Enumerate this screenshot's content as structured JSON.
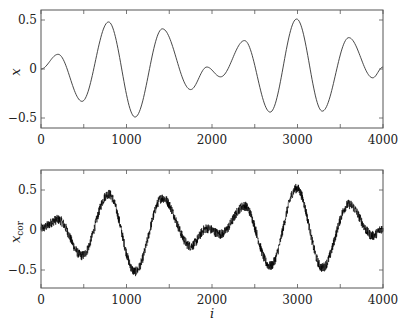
{
  "chart_data": [
    {
      "type": "line",
      "title": "",
      "xlabel": "",
      "ylabel": "x",
      "xlim": [
        0,
        4000
      ],
      "ylim": [
        -0.58,
        0.58
      ],
      "xticks": [
        "0",
        "1000",
        "2000",
        "3000",
        "4000"
      ],
      "yticks": [
        "-0.5",
        "0",
        "0.5"
      ],
      "grid": false,
      "series": [
        {
          "name": "x",
          "x": [
            0,
            200,
            480,
            790,
            1100,
            1420,
            1750,
            1940,
            2100,
            2380,
            2680,
            2990,
            3290,
            3600,
            3880,
            4000
          ],
          "values": [
            0.0,
            0.15,
            -0.33,
            0.48,
            -0.49,
            0.41,
            -0.21,
            0.02,
            -0.08,
            0.29,
            -0.44,
            0.51,
            -0.43,
            0.32,
            -0.09,
            0.02
          ]
        }
      ]
    },
    {
      "type": "line",
      "title": "",
      "xlabel": "i",
      "ylabel": "x_cor",
      "xlim": [
        0,
        4000
      ],
      "ylim": [
        -0.6,
        0.6
      ],
      "xticks": [
        "0",
        "1000",
        "2000",
        "3000",
        "4000"
      ],
      "yticks": [
        "-0.5",
        "0",
        "0.5"
      ],
      "grid": false,
      "series": [
        {
          "name": "x_cor (noisy)",
          "x": [
            0,
            200,
            480,
            790,
            1100,
            1420,
            1750,
            1940,
            2100,
            2380,
            2680,
            2990,
            3290,
            3600,
            3880,
            4000
          ],
          "values": [
            0.02,
            0.13,
            -0.32,
            0.45,
            -0.52,
            0.4,
            -0.2,
            0.02,
            -0.05,
            0.3,
            -0.45,
            0.52,
            -0.47,
            0.32,
            -0.07,
            0.02
          ],
          "noise_amplitude": 0.06
        }
      ]
    }
  ],
  "labels": {
    "top_ylabel": "x",
    "bottom_ylabel_main": "x",
    "bottom_ylabel_sub": "cor",
    "bottom_xlabel": "i"
  }
}
